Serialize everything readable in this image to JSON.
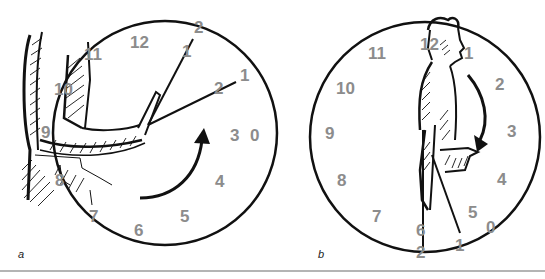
{
  "figure": {
    "panels": [
      {
        "id": "a",
        "label": "a",
        "description": "Arm raising in front of body drawn over a clock face; pointer lines indicate angular positions",
        "clock_numbers": [
          "12",
          "1",
          "2",
          "3",
          "4",
          "5",
          "6",
          "7",
          "8",
          "9",
          "10",
          "11"
        ],
        "outer_markers": [
          "2",
          "1",
          "0"
        ],
        "inner_markers": [
          "1",
          "2"
        ],
        "arrow_direction": "counterclockwise-up"
      },
      {
        "id": "b",
        "label": "b",
        "description": "Standing figure in side view with forearm bent forward drawn over a clock face; pointer line indicates angular position",
        "clock_numbers": [
          "12",
          "1",
          "2",
          "3",
          "4",
          "5",
          "6",
          "7",
          "8",
          "9",
          "10",
          "11"
        ],
        "outer_markers": [
          "2",
          "1",
          "0"
        ],
        "arrow_direction": "clockwise-down"
      }
    ],
    "colors": {
      "line": "#111111",
      "numbers": "#8c8c8c",
      "rule": "#b4b4b4"
    }
  }
}
